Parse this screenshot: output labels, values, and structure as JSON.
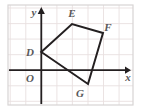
{
  "figure": {
    "frame": {
      "x": 8,
      "y": 5,
      "width": 125,
      "height": 100,
      "border_color": "#d8d4d4"
    },
    "grid": {
      "visible": true,
      "spacing_px": 15.55,
      "color": "#e9e0e0",
      "x_lines": [
        10.2,
        25.8,
        41.3,
        56.9,
        72.4,
        88.0,
        103.5,
        119.1
      ],
      "y_lines": [
        8.0,
        23.6,
        39.1,
        54.7,
        70.2,
        85.8,
        101.3
      ]
    },
    "axes": {
      "color": "#231f20",
      "origin_px": {
        "x": 41.3,
        "y": 70.2
      },
      "x_axis": {
        "from_x": 9,
        "to_x": 130,
        "y": 70.2,
        "arrow": "right"
      },
      "y_axis": {
        "x": 41.3,
        "from_y": 104,
        "to_y": 8,
        "arrow": "up"
      },
      "x_label": "x",
      "y_label": "y",
      "x_label_pos": {
        "x": 128,
        "y": 81
      },
      "y_label_pos": {
        "x": 34,
        "y": 16
      }
    },
    "origin": {
      "label": "O",
      "pos": {
        "x": 30,
        "y": 82
      }
    },
    "shape": {
      "name": "DEFG",
      "stroke_color": "#231f20",
      "stroke_width": 2,
      "fill": "none",
      "vertices": [
        {
          "label": "D",
          "px": {
            "x": 41.3,
            "y": 52.0
          },
          "grid": {
            "x": 0,
            "y": 1.17
          },
          "label_pos": {
            "x": 30,
            "y": 56
          }
        },
        {
          "label": "E",
          "px": {
            "x": 72.0,
            "y": 24.0
          },
          "grid": {
            "x": 2,
            "y": 2.97
          },
          "label_pos": {
            "x": 72,
            "y": 17
          }
        },
        {
          "label": "F",
          "px": {
            "x": 103.0,
            "y": 33.0
          },
          "grid": {
            "x": 4,
            "y": 2.39
          },
          "label_pos": {
            "x": 107,
            "y": 30
          }
        },
        {
          "label": "G",
          "px": {
            "x": 88.0,
            "y": 84.0
          },
          "grid": {
            "x": 3,
            "y": -0.89
          },
          "label_pos": {
            "x": 80,
            "y": 96
          }
        }
      ],
      "path": "M41.3,52 L72,24 L103,33 L88,84 Z"
    }
  }
}
